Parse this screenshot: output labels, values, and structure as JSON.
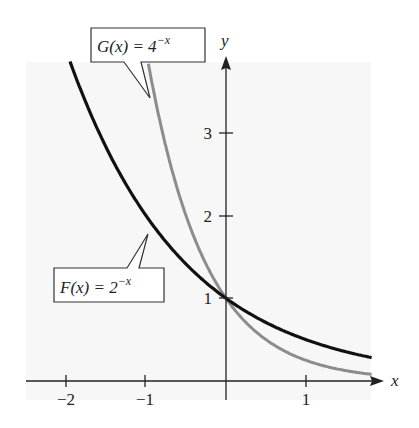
{
  "chart_data": {
    "type": "line",
    "title": "",
    "xlabel": "x",
    "ylabel": "y",
    "xlim": [
      -2.5,
      1.85
    ],
    "ylim": [
      -0.3,
      4.3
    ],
    "x_ticks": [
      -2,
      -1,
      1
    ],
    "x_tick_labels": [
      "−2",
      "−1",
      "1"
    ],
    "y_ticks": [
      1,
      2,
      3
    ],
    "y_tick_labels": [
      "1",
      "2",
      "3"
    ],
    "grid": false,
    "legend": "none (callout labels)",
    "series": [
      {
        "name": "F(x) = 2^(-x)",
        "label_text": "F(x) = 2",
        "label_exp": "−x",
        "function": "2^(-x)",
        "color": "#000000",
        "x": [
          -2.1,
          -2,
          -1.5,
          -1,
          -0.5,
          0,
          0.5,
          1,
          1.5,
          1.8
        ],
        "values": [
          4.29,
          4,
          2.83,
          2,
          1.41,
          1,
          0.71,
          0.5,
          0.35,
          0.29
        ]
      },
      {
        "name": "G(x) = 4^(-x)",
        "label_text": "G(x) = 4",
        "label_exp": "−x",
        "function": "4^(-x)",
        "color": "#8a8a8a",
        "x": [
          -1.05,
          -1,
          -0.75,
          -0.5,
          -0.25,
          0,
          0.25,
          0.5,
          1,
          1.5,
          1.8
        ],
        "values": [
          4.29,
          4,
          2.83,
          2,
          1.41,
          1,
          0.71,
          0.5,
          0.25,
          0.125,
          0.08
        ]
      }
    ],
    "annotations": [
      {
        "text": "G(x) = 4^(-x)",
        "points_to": "gray curve near x=-0.8"
      },
      {
        "text": "F(x) = 2^(-x)",
        "points_to": "black curve near x=-0.95"
      }
    ]
  },
  "labels": {
    "x_axis": "x",
    "y_axis": "y",
    "xt_m2": "−2",
    "xt_m1": "−1",
    "xt_1": "1",
    "yt_1": "1",
    "yt_2": "2",
    "yt_3": "3",
    "g_base": "G(x) = 4",
    "g_exp": "−x",
    "f_base": "F(x) = 2",
    "f_exp": "−x"
  },
  "colors": {
    "f_curve": "#111111",
    "g_curve": "#8c8c8c",
    "axis": "#222222",
    "plot_bg": "#f6f6f6"
  }
}
